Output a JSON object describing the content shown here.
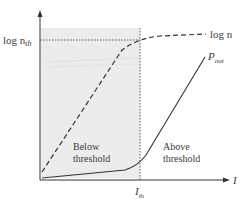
{
  "diagram": {
    "title": "",
    "axes": {
      "x_label": "I",
      "y_tick_label": "log n",
      "y_tick_subscript": "th",
      "x_tick_label": "I",
      "x_tick_subscript": "th"
    },
    "curves": [
      {
        "name": "log n",
        "label": "log n",
        "style": "dashed"
      },
      {
        "name": "P_out",
        "label": "P",
        "label_subscript": "out",
        "style": "solid"
      }
    ],
    "regions": [
      {
        "name": "below-threshold",
        "line1": "Below",
        "line2": "threshold",
        "shaded": true
      },
      {
        "name": "above-threshold",
        "line1": "Above",
        "line2": "threshold",
        "shaded": false
      }
    ],
    "colors": {
      "shade": "#ececec",
      "line": "#333333",
      "text": "#3a3a3a"
    }
  }
}
